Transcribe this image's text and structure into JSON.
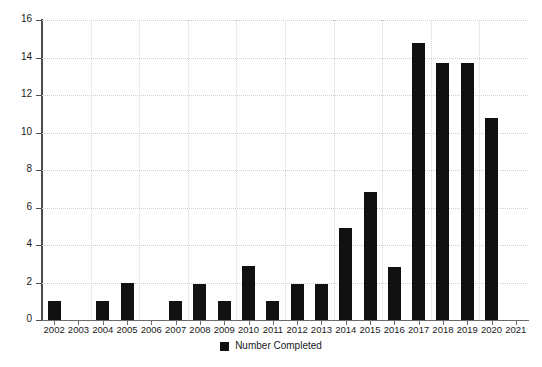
{
  "chart_data": {
    "type": "bar",
    "title": "",
    "subtitle": "",
    "xlabel": "",
    "ylabel": "",
    "categories": [
      "2002",
      "2003",
      "2004",
      "2005",
      "2006",
      "2007",
      "2008",
      "2009",
      "2010",
      "2011",
      "2012",
      "2013",
      "2014",
      "2015",
      "2016",
      "2017",
      "2018",
      "2019",
      "2020",
      "2021"
    ],
    "series": [
      {
        "name": "Number Completed",
        "color": "#111111",
        "values": [
          1,
          0,
          1,
          1.95,
          0,
          1,
          1.9,
          1,
          2.9,
          1,
          1.9,
          1.9,
          4.9,
          6.85,
          2.85,
          14.8,
          13.7,
          13.7,
          10.8,
          0
        ]
      }
    ],
    "ylim": [
      0,
      16
    ],
    "yticks": [
      0,
      2,
      4,
      6,
      8,
      10,
      12,
      14,
      16
    ],
    "ytick_labels": [
      "0",
      "2",
      "4",
      "6",
      "8",
      "10",
      "12",
      "14",
      "16"
    ],
    "grid": true,
    "grid_axis": "both",
    "legend": {
      "position": "bottom",
      "entries": [
        {
          "label": "Number Completed",
          "color": "#111111",
          "marker": "square-swatch"
        }
      ]
    },
    "background_color": "#ffffff",
    "axis_color": "#4d4d4d",
    "gridline_color": "#cfcfcf"
  }
}
